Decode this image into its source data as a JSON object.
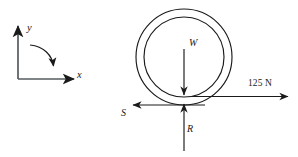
{
  "figure": {
    "name": "free-body-diagram-of-wheel",
    "background_color": "#ffffff",
    "stroke_color": "#1a1a1a",
    "width": 298,
    "height": 157,
    "coordinate_frame": {
      "name": "xy-axes-with-rotation",
      "y_axis_label": "y",
      "x_axis_label": "x",
      "rotation_arc_direction": "clockwise"
    },
    "body": {
      "name": "wheel",
      "shape": "two-concentric-circles",
      "outer_circle": {
        "cx": 184,
        "cy": 57,
        "r": 48
      },
      "inner_circle": {
        "cx": 184,
        "cy": 57,
        "r": 40
      }
    },
    "forces": [
      {
        "label": "W",
        "name": "weight-force",
        "direction": "down",
        "italic": true
      },
      {
        "label": "R",
        "name": "normal-reaction-force",
        "direction": "up",
        "italic": true
      },
      {
        "label": "S",
        "name": "friction-force",
        "direction": "left",
        "italic": true
      },
      {
        "label": "125 N",
        "name": "applied-force",
        "direction": "right",
        "italic": false
      }
    ]
  }
}
